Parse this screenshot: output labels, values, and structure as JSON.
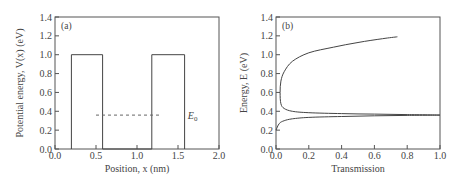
{
  "chart_data": [
    {
      "type": "line",
      "panel_label": "(a)",
      "title": "",
      "xlabel": "Position, x (nm)",
      "ylabel": "Potential energy, V(x) (eV)",
      "xlim": [
        0.0,
        2.0
      ],
      "ylim": [
        0.0,
        1.4
      ],
      "xticks": [
        "0.0",
        "0.5",
        "1.0",
        "1.5",
        "2.0"
      ],
      "yticks": [
        "0.0",
        "0.2",
        "0.4",
        "0.6",
        "0.8",
        "1.0",
        "1.2",
        "1.4"
      ],
      "grid": false,
      "series": [
        {
          "name": "V(x) double barrier",
          "style": "solid",
          "x": [
            0.2,
            0.2,
            0.58,
            0.58,
            1.18,
            1.18,
            1.58,
            1.58
          ],
          "y": [
            0.0,
            1.0,
            1.0,
            0.0,
            0.0,
            1.0,
            1.0,
            0.0
          ]
        },
        {
          "name": "E0",
          "style": "dashed",
          "x": [
            0.5,
            1.3
          ],
          "y": [
            0.36,
            0.36
          ]
        }
      ],
      "annotations": [
        {
          "text": "E",
          "subscript": "0",
          "x": 1.62,
          "y": 0.36
        }
      ]
    },
    {
      "type": "line",
      "panel_label": "(b)",
      "title": "",
      "xlabel": "Transmission",
      "ylabel": "Energy, E (eV)",
      "xlim": [
        0.0,
        1.0
      ],
      "ylim": [
        0.0,
        1.4
      ],
      "xticks": [
        "0.0",
        "0.2",
        "0.4",
        "0.6",
        "0.8",
        "1.0"
      ],
      "yticks": [
        "0.0",
        "0.2",
        "0.4",
        "0.6",
        "0.8",
        "1.0",
        "1.2",
        "1.4"
      ],
      "grid": false,
      "series": [
        {
          "name": "Transmission vs Energy",
          "style": "solid",
          "x": [
            0.0,
            0.02,
            0.05,
            0.1,
            0.2,
            0.4,
            0.6,
            0.8,
            1.0,
            0.8,
            0.6,
            0.4,
            0.2,
            0.1,
            0.05,
            0.03,
            0.025,
            0.03,
            0.05,
            0.1,
            0.2,
            0.35,
            0.5,
            0.65,
            0.74
          ],
          "y": [
            0.2,
            0.27,
            0.3,
            0.32,
            0.335,
            0.345,
            0.352,
            0.356,
            0.36,
            0.365,
            0.37,
            0.375,
            0.385,
            0.4,
            0.43,
            0.48,
            0.6,
            0.72,
            0.82,
            0.93,
            1.02,
            1.08,
            1.13,
            1.17,
            1.19
          ]
        }
      ]
    }
  ]
}
